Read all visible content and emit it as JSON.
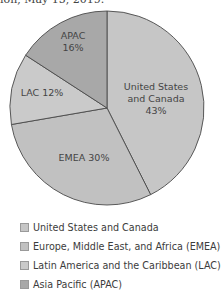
{
  "caption": "ion, May 15, 2019.",
  "chart_data": {
    "type": "pie",
    "title": "",
    "categories": [
      "United States and Canada",
      "Europe, Middle East, and Africa (EMEA)",
      "Latin America and the Caribbean (LAC)",
      "Asia Pacific (APAC)"
    ],
    "short_labels": [
      "United States and Canada",
      "EMEA",
      "LAC",
      "APAC"
    ],
    "values": [
      43,
      30,
      12,
      16
    ],
    "unit": "%",
    "colors": [
      "#c6c6c6",
      "#c1c1c1",
      "#cacaca",
      "#a8a8a8"
    ],
    "slice_labels": [
      {
        "lines": [
          "United States",
          "and Canada",
          "43%"
        ]
      },
      {
        "lines": [
          "EMEA 30%"
        ]
      },
      {
        "lines": [
          "LAC 12%"
        ]
      },
      {
        "lines": [
          "APAC",
          "16%"
        ]
      }
    ],
    "legend_position": "bottom",
    "start_angle": "12 o'clock, clockwise"
  },
  "legend": [
    {
      "label": "United States and Canada",
      "color": "#c6c6c6"
    },
    {
      "label": "Europe, Middle East, and Africa (EMEA)",
      "color": "#c1c1c1"
    },
    {
      "label": "Latin America and the Caribbean (LAC)",
      "color": "#cacaca"
    },
    {
      "label": "Asia Pacific (APAC)",
      "color": "#a8a8a8"
    }
  ]
}
